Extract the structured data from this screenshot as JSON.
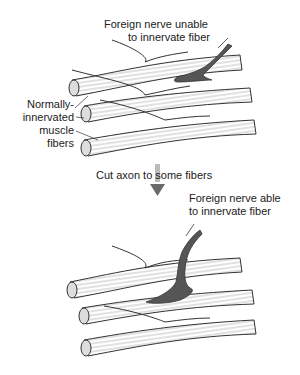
{
  "diagram": {
    "top_panel": {
      "label_foreign_unable": [
        "Foreign nerve unable",
        "to innervate fiber"
      ],
      "label_normal": [
        "Normally-",
        "innervated",
        "muscle",
        "fibers"
      ]
    },
    "transition": {
      "label": "Cut axon to some fibers",
      "arrow": "down-arrow"
    },
    "bottom_panel": {
      "label_foreign_able": [
        "Foreign nerve able",
        "to innervate fiber"
      ]
    },
    "colors": {
      "nerve_fill": "#555555",
      "fiber_fill": "#ffffff",
      "outline": "#333333",
      "arrow": "#6a6a6a"
    }
  }
}
